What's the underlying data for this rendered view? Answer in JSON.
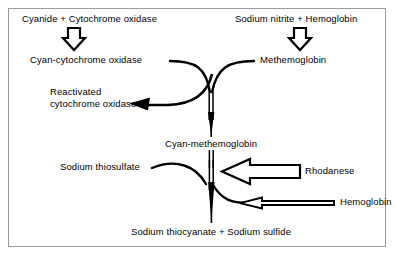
{
  "diagram": {
    "frame_border_color": "#9a9a9a",
    "ink_color": "#000000",
    "background": "#ffffff",
    "labels": {
      "cyanide_cytochrome_oxidase": "Cyanide + Cytochrome oxidase",
      "cyan_cytochrome_oxidase": "Cyan-cytochrome oxidase",
      "reactivated_line1": "Reactivated",
      "reactivated_line2": "cytochrome oxidase",
      "sodium_nitrite_hemoglobin": "Sodium nitrite + Hemoglobin",
      "methemoglobin": "Methemoglobin",
      "cyan_methemoglobin": "Cyan-methemoglobin",
      "sodium_thiosulfate": "Sodium thiosulfate",
      "rhodanese": "Rhodanese",
      "hemoglobin": "Hemoglobin",
      "sodium_thiocyanate_sulfide": "Sodium thiocyanate + Sodium sulfide"
    },
    "icons": {
      "down_block_arrow_left": "down-block-arrow-icon",
      "down_block_arrow_right": "down-block-arrow-icon",
      "rhodanese_block_arrow": "left-block-arrow-icon",
      "hemoglobin_thin_arrow": "left-thin-hollow-arrow-icon",
      "reactivated_curve_arrow": "curved-left-arrow-icon",
      "cyan_methemoglobin_arrow": "down-taper-arrow-icon",
      "thiocyanate_arrow": "down-taper-arrow-icon"
    }
  }
}
